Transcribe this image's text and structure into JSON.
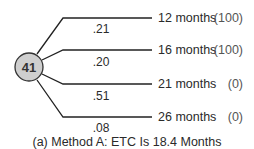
{
  "node": {
    "label": "41",
    "fill": "#cfcfcf"
  },
  "branches": [
    {
      "duration": "12 months",
      "score": "(100)",
      "probability": ".21"
    },
    {
      "duration": "16 months",
      "score": "(100)",
      "probability": ".20"
    },
    {
      "duration": "21 months",
      "score": "(0)",
      "probability": ".51"
    },
    {
      "duration": "26 months",
      "score": "(0)",
      "probability": ".08"
    }
  ],
  "caption": "(a) Method A:  ETC Is 18.4 Months"
}
